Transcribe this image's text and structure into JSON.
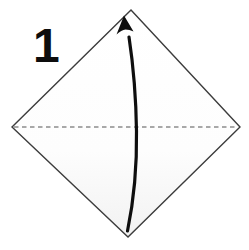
{
  "step": {
    "label": "1"
  },
  "diagram": {
    "type": "origami-fold-step",
    "paper": "square sheet rotated 45 degrees (diamond orientation)",
    "fold_line": "horizontal dashed valley-fold crease through the middle, left corner to right corner",
    "arrow": "curved solid black arrow from bottom corner up to top corner, bowed slightly right, indicating fold bottom point up to top point"
  },
  "colors": {
    "background": "#ffffff",
    "paper_edge": "#3c3c3c",
    "paper_fill_top": "#ffffff",
    "paper_fill_bottom": "#f2f2f2",
    "fold_line": "#8c8c8c",
    "arrow": "#0e0e0e",
    "step_number": "#0d0d0d"
  }
}
